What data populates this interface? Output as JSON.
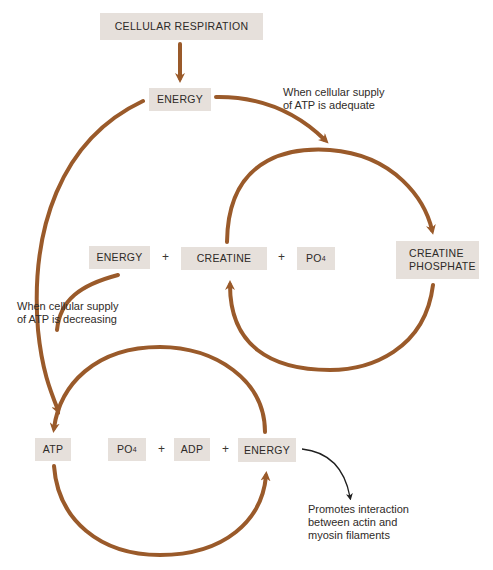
{
  "diagram": {
    "title_box": "CELLULAR RESPIRATION",
    "energy_top": "ENERGY",
    "note_adequate_line1": "When cellular supply",
    "note_adequate_line2": "of ATP is adequate",
    "middle_row": {
      "energy": "ENERGY",
      "plus1": "+",
      "creatine": "CREATINE",
      "plus2": "+",
      "po4_base": "PO",
      "po4_sub": "4",
      "creatine_phosphate_line1": "CREATINE",
      "creatine_phosphate_line2": "PHOSPHATE"
    },
    "note_decreasing_line1": "When cellular supply",
    "note_decreasing_line2": "of ATP is decreasing",
    "bottom_row": {
      "atp": "ATP",
      "po4_base": "PO",
      "po4_sub": "4",
      "plus1": "+",
      "adp": "ADP",
      "plus2": "+",
      "energy": "ENERGY"
    },
    "note_promotes_line1": "Promotes interaction",
    "note_promotes_line2": "between actin and",
    "note_promotes_line3": "myosin filaments",
    "colors": {
      "arrow": "#9a5a2a",
      "box": "#e6e0db",
      "black_arrow": "#1f1f1f"
    }
  }
}
